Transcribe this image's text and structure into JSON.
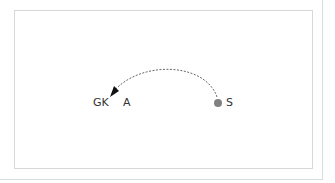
{
  "diagram": {
    "players": [
      {
        "id": "GK",
        "label": "GK",
        "x": 93,
        "y": 97
      },
      {
        "id": "A",
        "label": "A",
        "x": 123,
        "y": 97
      },
      {
        "id": "S",
        "label": "S",
        "x": 226,
        "y": 97
      }
    ],
    "ball": {
      "x": 218,
      "y": 103,
      "r": 4,
      "color": "#808080"
    },
    "pass": {
      "from": "S",
      "to": "GK",
      "style": "dashed",
      "color": "#555555"
    },
    "colors": {
      "frame": "#d8d8d8",
      "text": "#333333"
    }
  }
}
